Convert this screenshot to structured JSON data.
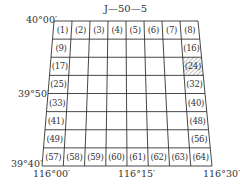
{
  "sheet": {
    "title": "J—50—5",
    "corners": {
      "top_left": "40°00′",
      "mid_left": "39°50′",
      "bottom_left": "39°40′"
    },
    "bottom_labels": {
      "left": "116°00′",
      "middle": "116°15′",
      "right": "116°30′"
    },
    "grid": {
      "rows": 8,
      "cols": 8
    },
    "top_row": [
      "(1)",
      "(2)",
      "(3)",
      "(4)",
      "(5)",
      "(6)",
      "(7)",
      "(8)"
    ],
    "left_col": [
      "(9)",
      "(17)",
      "(25)",
      "(33)",
      "(41)",
      "(49)"
    ],
    "right_col": [
      "(16)",
      "(24)",
      "(32)",
      "(40)",
      "(48)",
      "(56)"
    ],
    "bottom_row": [
      "(57)",
      "(58)",
      "(59)",
      "(60)",
      "(61)",
      "(62)",
      "(63)",
      "(64)"
    ],
    "highlighted_cell": "(24)",
    "colors": {
      "line": "#333333",
      "hatch": "#888888",
      "background": "#ffffff"
    }
  }
}
